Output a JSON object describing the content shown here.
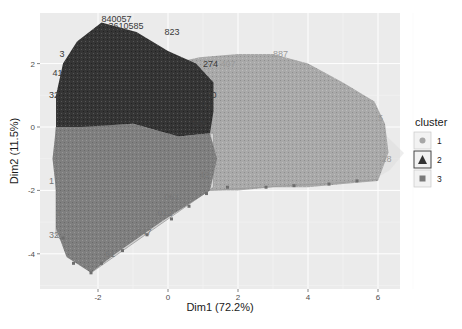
{
  "chart_data": {
    "type": "scatter",
    "subtype": "cluster-plot (fviz_cluster style, k-means on PCA)",
    "title": "",
    "xlabel": "Dim1 (72.2%)",
    "ylabel": "Dim2 (11.5%)",
    "xlim": [
      -3.8,
      6.5
    ],
    "ylim": [
      -5.1,
      3.5
    ],
    "x_ticks": [
      -2,
      0,
      2,
      4,
      6
    ],
    "y_ticks": [
      2,
      0,
      -2,
      -4
    ],
    "grid": true,
    "legend": {
      "title": "cluster",
      "position": "right",
      "entries": [
        {
          "label": "1",
          "shape": "circle",
          "color": "#a6a6a6"
        },
        {
          "label": "2",
          "shape": "triangle",
          "color": "#333333"
        },
        {
          "label": "3",
          "shape": "square",
          "color": "#7a7a7a"
        }
      ]
    },
    "clusters": [
      {
        "name": "1",
        "color": "#a8a8a8",
        "hull": [
          [
            0.1,
            2.0
          ],
          [
            0.9,
            2.2
          ],
          [
            2.0,
            2.3
          ],
          [
            3.0,
            2.3
          ],
          [
            4.0,
            2.0
          ],
          [
            5.0,
            1.4
          ],
          [
            5.9,
            0.8
          ],
          [
            6.2,
            0.1
          ],
          [
            6.3,
            -0.8
          ],
          [
            6.0,
            -1.7
          ],
          [
            5.0,
            -1.8
          ],
          [
            4.0,
            -1.9
          ],
          [
            3.0,
            -1.9
          ],
          [
            2.0,
            -2.0
          ],
          [
            1.2,
            -2.0
          ],
          [
            0.7,
            -1.8
          ],
          [
            0.2,
            -1.2
          ],
          [
            0.0,
            0.0
          ]
        ],
        "sample_labels": [
          "887",
          "28",
          "07",
          "55"
        ]
      },
      {
        "name": "2",
        "color": "#333333",
        "hull": [
          [
            -3.2,
            0.0
          ],
          [
            -3.2,
            1.0
          ],
          [
            -3.0,
            2.0
          ],
          [
            -2.6,
            2.7
          ],
          [
            -1.9,
            3.3
          ],
          [
            -0.9,
            3.0
          ],
          [
            0.0,
            2.4
          ],
          [
            0.8,
            2.0
          ],
          [
            1.3,
            1.4
          ],
          [
            1.3,
            0.5
          ],
          [
            1.2,
            -0.2
          ],
          [
            0.3,
            -0.3
          ],
          [
            -1.0,
            0.1
          ],
          [
            -2.5,
            0.0
          ]
        ],
        "sample_labels": [
          "32",
          "41",
          "3",
          "823",
          "274",
          "555",
          "70",
          "62"
        ]
      },
      {
        "name": "3",
        "color": "#808080",
        "hull": [
          [
            -3.2,
            0.0
          ],
          [
            -1.0,
            0.1
          ],
          [
            0.3,
            -0.3
          ],
          [
            1.2,
            -0.2
          ],
          [
            1.4,
            -1.0
          ],
          [
            1.2,
            -2.0
          ],
          [
            -0.2,
            -3.0
          ],
          [
            -1.5,
            -4.0
          ],
          [
            -2.2,
            -4.6
          ],
          [
            -2.9,
            -4.1
          ],
          [
            -3.2,
            -3.2
          ],
          [
            -3.2,
            -2.0
          ],
          [
            -3.3,
            -1.0
          ]
        ],
        "sample_labels": [
          "1",
          "3",
          "32",
          "647",
          "012",
          "061",
          "42",
          "61"
        ]
      }
    ]
  },
  "caption_fragment": "Fig. ..."
}
